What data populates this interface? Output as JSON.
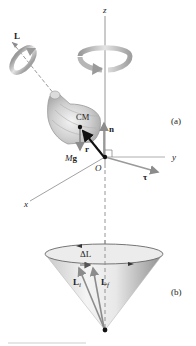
{
  "figure": {
    "part_labels": {
      "a": "(a)",
      "b": "(b)"
    },
    "axes": {
      "z": "z",
      "y": "y",
      "x": "x",
      "origin": "O"
    },
    "vectors": {
      "angular_momentum": "L",
      "center_of_mass": "CM",
      "normal_force": "n",
      "position": "r",
      "weight": "Mg",
      "weight_M": "M",
      "weight_g": "g",
      "torque": "τ",
      "delta_L": "ΔL",
      "L_initial": "L",
      "L_initial_sub": "i",
      "L_final": "L",
      "L_final_sub": "f"
    },
    "colors": {
      "axis": "#8a8a8a",
      "vector_gray": "#8c8c8c",
      "vector_black": "#111111",
      "top_body": "#cfcfcf",
      "cone_light": "#f2f2f2",
      "cone_dark": "#9a9a9a",
      "text": "#222222"
    }
  }
}
